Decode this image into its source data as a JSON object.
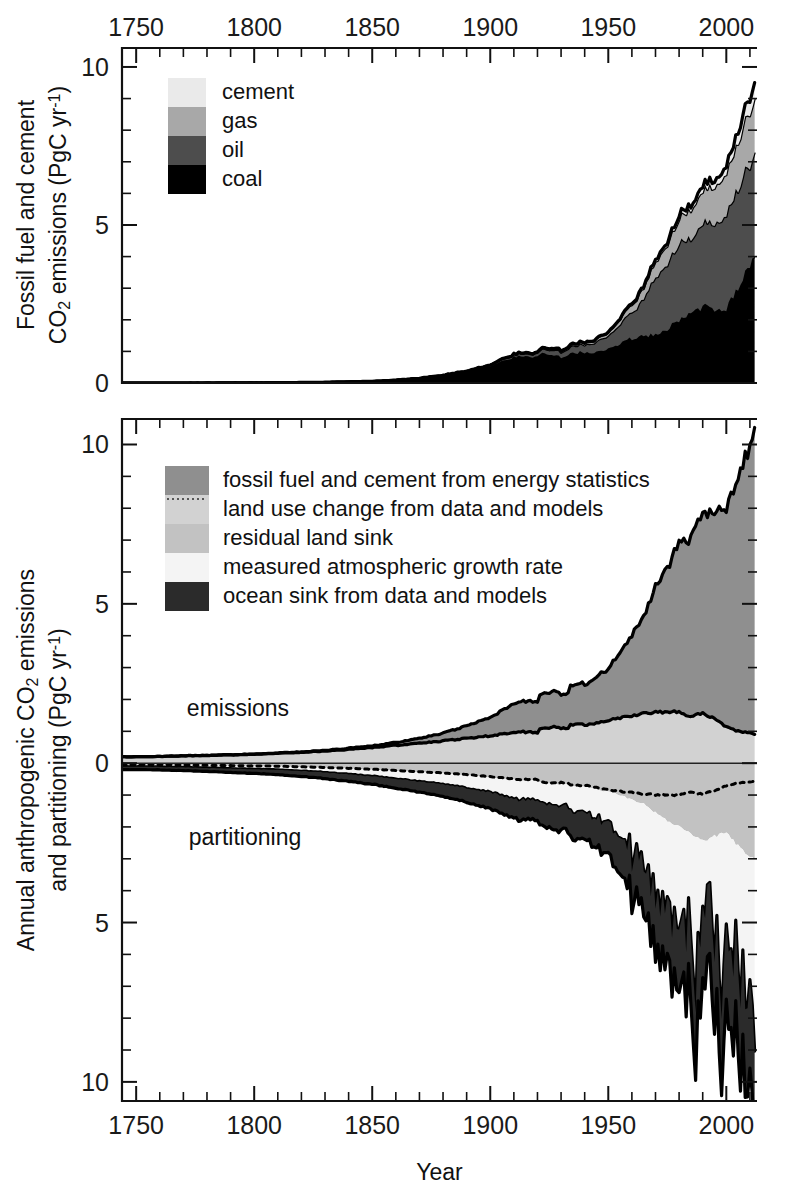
{
  "figure": {
    "xlabel": "Year",
    "x_ticks": [
      "1750",
      "1800",
      "1850",
      "1900",
      "1950",
      "2000"
    ],
    "x_tick_values": [
      1750,
      1800,
      1850,
      1900,
      1950,
      2000
    ],
    "xlim": [
      1744,
      2013
    ]
  },
  "panel_top": {
    "ylabel_line1": "Fossil fuel and cement",
    "ylabel_line2": "CO",
    "ylabel_sub": "2",
    "ylabel_line2b": " emissions (PgC yr",
    "ylabel_sup": "-1",
    "ylabel_line2c": ")",
    "y_ticks": [
      "0",
      "5",
      "10"
    ],
    "y_tick_values": [
      0,
      5,
      10
    ],
    "ylim": [
      0,
      10.6
    ],
    "legend": [
      {
        "label": "cement",
        "color": "#eaeaea"
      },
      {
        "label": "gas",
        "color": "#a8a8a8"
      },
      {
        "label": "oil",
        "color": "#4d4d4d"
      },
      {
        "label": "coal",
        "color": "#000000"
      }
    ]
  },
  "panel_bottom": {
    "ylabel_line1": "Annual anthropogenic CO",
    "ylabel_sub": "2",
    "ylabel_line1b": " emissions",
    "ylabel_line2": "and partitioning (PgC yr",
    "ylabel_sup": "-1",
    "ylabel_line2b": ")",
    "y_ticks": [
      "10",
      "5",
      "0",
      "5",
      "10"
    ],
    "y_tick_values": [
      10,
      5,
      0,
      -5,
      -10
    ],
    "ylim": [
      -10.6,
      10.8
    ],
    "annotation_upper": "emissions",
    "annotation_lower": "partitioning",
    "legend": [
      {
        "label": "fossil fuel and cement from energy statistics",
        "color": "#8f8f8f",
        "dotted": false
      },
      {
        "label": "land use change from data and models",
        "color": "#d2d2d2",
        "dotted": true
      },
      {
        "label": "residual land sink",
        "color": "#c2c2c2",
        "dotted": false
      },
      {
        "label": "measured atmospheric growth rate",
        "color": "#f4f4f4",
        "dotted": false
      },
      {
        "label": "ocean sink from data and models",
        "color": "#2b2b2b",
        "dotted": false
      }
    ]
  },
  "chart_data": [
    {
      "type": "area",
      "id": "fossil-fuel-cement-by-source",
      "title": "Fossil fuel and cement CO2 emissions by source",
      "xlabel": "Year",
      "ylabel": "Fossil fuel and cement CO2 emissions (PgC yr-1)",
      "stacked": true,
      "xlim": [
        1744,
        2013
      ],
      "ylim": [
        0,
        10.6
      ],
      "grid": false,
      "legend_position": "upper-left",
      "x": [
        1750,
        1760,
        1770,
        1780,
        1790,
        1800,
        1810,
        1820,
        1830,
        1840,
        1850,
        1860,
        1870,
        1880,
        1890,
        1900,
        1910,
        1920,
        1930,
        1940,
        1950,
        1955,
        1960,
        1965,
        1970,
        1975,
        1980,
        1985,
        1990,
        1995,
        2000,
        2005,
        2010,
        2012
      ],
      "series": [
        {
          "name": "coal",
          "color": "#000000",
          "values": [
            0.003,
            0.003,
            0.004,
            0.005,
            0.007,
            0.008,
            0.011,
            0.017,
            0.024,
            0.038,
            0.054,
            0.091,
            0.147,
            0.236,
            0.371,
            0.53,
            0.819,
            0.932,
            0.88,
            0.99,
            1.07,
            1.25,
            1.41,
            1.48,
            1.55,
            1.72,
            1.98,
            2.2,
            2.42,
            2.36,
            2.38,
            3.0,
            3.7,
            3.95
          ]
        },
        {
          "name": "oil",
          "color": "#4d4d4d",
          "values": [
            0,
            0,
            0,
            0,
            0,
            0,
            0,
            0,
            0,
            0,
            0,
            0.001,
            0.003,
            0.007,
            0.016,
            0.038,
            0.073,
            0.124,
            0.192,
            0.263,
            0.423,
            0.62,
            0.85,
            1.13,
            1.84,
            2.05,
            2.42,
            2.32,
            2.62,
            2.76,
            2.96,
            3.15,
            3.2,
            3.22
          ]
        },
        {
          "name": "gas",
          "color": "#a8a8a8",
          "values": [
            0,
            0,
            0,
            0,
            0,
            0,
            0,
            0,
            0,
            0,
            0,
            0,
            0,
            0,
            0.001,
            0.003,
            0.008,
            0.016,
            0.033,
            0.054,
            0.097,
            0.16,
            0.23,
            0.35,
            0.49,
            0.62,
            0.79,
            0.93,
            1.05,
            1.18,
            1.3,
            1.48,
            1.67,
            1.73
          ]
        },
        {
          "name": "cement",
          "color": "#eaeaea",
          "values": [
            0,
            0,
            0,
            0,
            0,
            0,
            0,
            0,
            0,
            0,
            0,
            0,
            0.001,
            0.002,
            0.003,
            0.005,
            0.01,
            0.013,
            0.021,
            0.021,
            0.018,
            0.028,
            0.042,
            0.056,
            0.073,
            0.086,
            0.11,
            0.13,
            0.16,
            0.2,
            0.23,
            0.33,
            0.45,
            0.52
          ]
        }
      ],
      "total_label": "total fossil fuel and cement emissions",
      "total_values": [
        0.003,
        0.003,
        0.004,
        0.005,
        0.007,
        0.008,
        0.011,
        0.017,
        0.024,
        0.038,
        0.054,
        0.092,
        0.151,
        0.245,
        0.391,
        0.576,
        0.91,
        1.085,
        1.126,
        1.328,
        1.608,
        2.058,
        2.532,
        3.016,
        3.953,
        4.476,
        5.3,
        5.58,
        6.25,
        6.5,
        6.87,
        7.96,
        9.02,
        9.42
      ]
    },
    {
      "type": "area",
      "id": "anthropogenic-co2-budget-partitioning",
      "title": "Annual anthropogenic CO2 emissions and partitioning",
      "xlabel": "Year",
      "ylabel": "Annual anthropogenic CO2 emissions and partitioning (PgC yr-1)",
      "stacked": true,
      "xlim": [
        1744,
        2013
      ],
      "ylim": [
        -10.6,
        10.8
      ],
      "grid": false,
      "legend_position": "upper-left",
      "note": "positive = sources (emissions), negative = sinks (partitioning)",
      "x": [
        1750,
        1760,
        1770,
        1780,
        1790,
        1800,
        1810,
        1820,
        1830,
        1840,
        1850,
        1860,
        1870,
        1880,
        1890,
        1900,
        1910,
        1920,
        1930,
        1940,
        1950,
        1955,
        1960,
        1965,
        1970,
        1975,
        1980,
        1985,
        1990,
        1995,
        2000,
        2005,
        2010,
        2012
      ],
      "series_emissions": [
        {
          "name": "land use change from data and models",
          "color": "#d2d2d2",
          "dotted": true,
          "values": [
            0.2,
            0.21,
            0.23,
            0.24,
            0.26,
            0.28,
            0.31,
            0.34,
            0.38,
            0.43,
            0.49,
            0.56,
            0.63,
            0.7,
            0.78,
            0.86,
            0.97,
            1.07,
            1.16,
            1.23,
            1.35,
            1.42,
            1.5,
            1.55,
            1.6,
            1.62,
            1.6,
            1.48,
            1.55,
            1.4,
            1.15,
            1.0,
            0.95,
            0.9
          ]
        },
        {
          "name": "fossil fuel and cement from energy statistics",
          "color": "#8f8f8f",
          "dotted": false,
          "values": [
            0.003,
            0.003,
            0.004,
            0.005,
            0.007,
            0.008,
            0.011,
            0.017,
            0.024,
            0.038,
            0.054,
            0.092,
            0.151,
            0.245,
            0.391,
            0.576,
            0.91,
            1.085,
            1.126,
            1.328,
            1.608,
            2.058,
            2.532,
            3.016,
            3.953,
            4.476,
            5.3,
            5.58,
            6.25,
            6.5,
            6.87,
            7.96,
            9.02,
            9.42
          ]
        }
      ],
      "series_partitioning": [
        {
          "name": "residual land sink",
          "color": "#c2c2c2",
          "values": [
            0.05,
            0.05,
            0.06,
            0.07,
            0.08,
            0.09,
            0.1,
            0.12,
            0.14,
            0.17,
            0.2,
            0.24,
            0.28,
            0.32,
            0.38,
            0.44,
            0.52,
            0.6,
            0.68,
            0.76,
            0.9,
            1.0,
            1.15,
            1.28,
            1.55,
            1.8,
            2.0,
            2.2,
            2.45,
            2.3,
            2.2,
            2.6,
            2.9,
            3.0
          ]
        },
        {
          "name": "measured atmospheric growth rate",
          "color": "#f4f4f4",
          "values": [
            0.06,
            0.07,
            0.07,
            0.08,
            0.09,
            0.1,
            0.11,
            0.13,
            0.15,
            0.18,
            0.21,
            0.25,
            0.29,
            0.34,
            0.41,
            0.48,
            0.58,
            0.67,
            0.74,
            0.85,
            1.0,
            1.3,
            1.6,
            1.9,
            2.5,
            2.6,
            3.0,
            3.1,
            3.2,
            3.4,
            3.3,
            4.0,
            4.8,
            5.1
          ]
        },
        {
          "name": "ocean sink from data and models",
          "color": "#2b2b2b",
          "values": [
            0.09,
            0.09,
            0.1,
            0.11,
            0.12,
            0.13,
            0.15,
            0.17,
            0.19,
            0.22,
            0.25,
            0.29,
            0.33,
            0.38,
            0.44,
            0.51,
            0.6,
            0.69,
            0.78,
            0.87,
            1.0,
            1.15,
            1.3,
            1.45,
            1.65,
            1.8,
            1.95,
            2.05,
            2.2,
            2.3,
            2.4,
            2.6,
            2.8,
            2.9
          ]
        }
      ]
    }
  ]
}
